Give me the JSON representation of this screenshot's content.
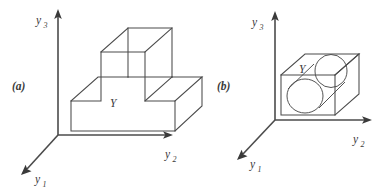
{
  "figure": {
    "background_color": "#ffffff",
    "stroke_color": "#4b4b4b",
    "text_color": "#3a3a3a",
    "panels": [
      {
        "id": "a",
        "label": "(a)",
        "label_pos": {
          "x": 14,
          "y": 87
        },
        "body_label": "Y",
        "body_label_pos": {
          "x": 114,
          "y": 103
        },
        "description": "stepped T-shaped rectangular solid in 3D axonometric view",
        "axes": {
          "origin": {
            "x": 58,
            "y": 135
          },
          "vertical": {
            "name": "y_3",
            "base": "y",
            "subscript": "3",
            "tip": {
              "x": 58,
              "y": 12
            },
            "label_pos": {
              "x": 39,
              "y": 22
            }
          },
          "horizontal": {
            "name": "y_2",
            "base": "y",
            "subscript": "2",
            "tip": {
              "x": 172,
              "y": 135
            },
            "label_pos": {
              "x": 167,
              "y": 156
            }
          },
          "depth": {
            "name": "y_1",
            "base": "y",
            "subscript": "1",
            "tip": {
              "x": 22,
              "y": 173
            },
            "label_pos": {
              "x": 34,
              "y": 181
            }
          }
        },
        "solid_outline": "M 71 131 L 71 101 L 101 101 L 101 52 L 145 52 L 145 101 L 175 101 L 175 131 Z",
        "solid_edges": [
          "M 71 101 L 98 77 L 128 77",
          "M 128 77 L 128 28",
          "M 101 52 L 128 28 L 172 28 L 172 77 L 145 101",
          "M 128 77 L 172 77",
          "M 175 101 L 202 77 L 172 77",
          "M 175 131 L 202 106 L 202 77"
        ]
      },
      {
        "id": "b",
        "label": "(b)",
        "label_pos": {
          "x": 219,
          "y": 87
        },
        "body_label": "Y",
        "body_label_pos": {
          "x": 303,
          "y": 69
        },
        "description": "rectangular box containing a cylinder, in 3D axonometric view",
        "axes": {
          "origin": {
            "x": 275,
            "y": 120
          },
          "vertical": {
            "name": "y_3",
            "base": "y",
            "subscript": "3",
            "tip": {
              "x": 275,
              "y": 14
            },
            "label_pos": {
              "x": 255,
              "y": 24
            }
          },
          "horizontal": {
            "name": "y_2",
            "base": "y",
            "subscript": "2",
            "tip": {
              "x": 372,
              "y": 120
            },
            "label_pos": {
              "x": 355,
              "y": 141
            }
          },
          "depth": {
            "name": "y_1",
            "base": "y",
            "subscript": "1",
            "tip": {
              "x": 237,
              "y": 158
            },
            "label_pos": {
              "x": 249,
              "y": 166
            }
          }
        },
        "box_front_face": "M 281 75 L 281 115 L 335 115 L 335 75 Z",
        "box_edges": [
          "M 281 75 L 305 54 L 359 54 L 335 75",
          "M 359 54 L 359 94 L 335 115",
          "M 335 75 L 359 54"
        ],
        "cylinder": {
          "front_circle": {
            "cx": 305,
            "cy": 96,
            "rx": 18,
            "ry": 17
          },
          "back_ellipse": {
            "cx": 331,
            "cy": 71,
            "rx": 16,
            "ry": 16.5
          },
          "connectors": [
            "M 289 88 L 315 63",
            "M 318 107 L 344 82"
          ]
        }
      }
    ]
  }
}
